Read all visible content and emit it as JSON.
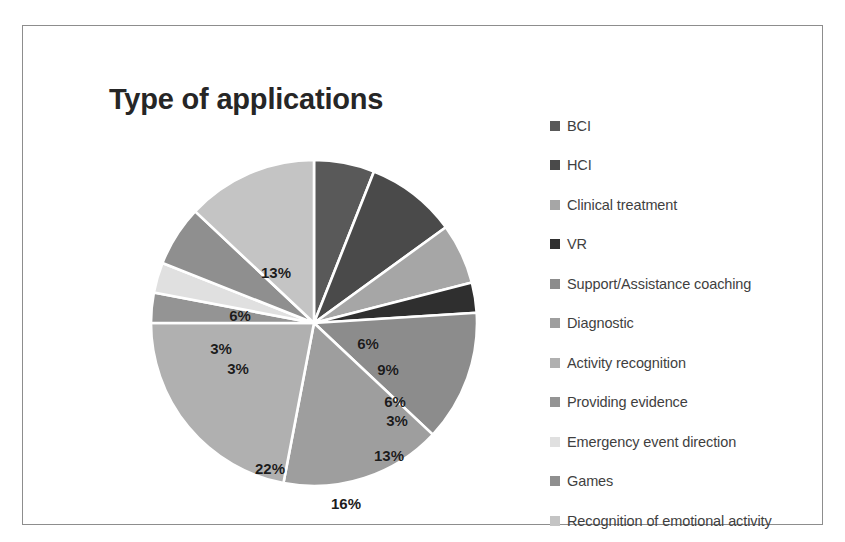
{
  "figure": {
    "title": "Type of applications",
    "frame_color": "#8d8d8d",
    "background": "#ffffff"
  },
  "chart_data": {
    "type": "pie",
    "title": "Type of applications",
    "xlabel": "",
    "ylabel": "",
    "legend_position": "right",
    "start_angle_deg": 0,
    "direction": "clockwise",
    "categories": [
      "BCI",
      "HCI",
      "Clinical treatment",
      "VR",
      "Support/Assistance coaching",
      "Diagnostic",
      "Activity recognition",
      "Providing evidence",
      "Emergency event direction",
      "Games",
      "Recognition of emotional activity"
    ],
    "values": [
      6,
      9,
      6,
      3,
      13,
      16,
      22,
      3,
      3,
      6,
      13
    ],
    "value_labels": [
      "6%",
      "9%",
      "6%",
      "3%",
      "13%",
      "16%",
      "22%",
      "3%",
      "3%",
      "6%",
      "13%"
    ],
    "colors": [
      "#595959",
      "#4a4a4a",
      "#a6a6a6",
      "#2f2f2f",
      "#8c8c8c",
      "#9e9e9e",
      "#b0b0b0",
      "#949494",
      "#e0e0e0",
      "#8f8f8f",
      "#c4c4c4"
    ],
    "slices": [
      {
        "label": "BCI",
        "value": 6,
        "value_label": "6%",
        "color": "#595959",
        "label_x": 54,
        "label_y": 20
      },
      {
        "label": "HCI",
        "value": 9,
        "value_label": "9%",
        "color": "#4a4a4a",
        "label_x": 74,
        "label_y": 46
      },
      {
        "label": "Clinical treatment",
        "value": 6,
        "value_label": "6%",
        "color": "#a6a6a6",
        "label_x": 81,
        "label_y": 78
      },
      {
        "label": "VR",
        "value": 3,
        "value_label": "3%",
        "color": "#2f2f2f",
        "label_x": 83,
        "label_y": 97
      },
      {
        "label": "Support/Assistance coaching",
        "value": 13,
        "value_label": "13%",
        "color": "#8c8c8c",
        "label_x": 75,
        "label_y": 132
      },
      {
        "label": "Diagnostic",
        "value": 16,
        "value_label": "16%",
        "color": "#9e9e9e",
        "label_x": 32,
        "label_y": 180
      },
      {
        "label": "Activity recognition",
        "value": 22,
        "value_label": "22%",
        "color": "#b0b0b0",
        "label_x": -44,
        "label_y": 145
      },
      {
        "label": "Providing evidence",
        "value": 3,
        "value_label": "3%",
        "color": "#949494",
        "label_x": -76,
        "label_y": 45
      },
      {
        "label": "Emergency event direction",
        "value": 3,
        "value_label": "3%",
        "color": "#e0e0e0",
        "label_x": -93,
        "label_y": 25
      },
      {
        "label": "Games",
        "value": 6,
        "value_label": "6%",
        "color": "#8f8f8f",
        "label_x": -74,
        "label_y": -8
      },
      {
        "label": "Recognition of emotional activity",
        "value": 13,
        "value_label": "13%",
        "color": "#c4c4c4",
        "label_x": -38,
        "label_y": -51
      }
    ]
  },
  "legend": {
    "items": [
      {
        "label": "BCI",
        "color": "#595959"
      },
      {
        "label": "HCI",
        "color": "#4a4a4a"
      },
      {
        "label": "Clinical treatment",
        "color": "#a6a6a6"
      },
      {
        "label": "VR",
        "color": "#2f2f2f"
      },
      {
        "label": "Support/Assistance coaching",
        "color": "#8c8c8c"
      },
      {
        "label": "Diagnostic",
        "color": "#9e9e9e"
      },
      {
        "label": "Activity recognition",
        "color": "#b0b0b0"
      },
      {
        "label": "Providing evidence",
        "color": "#949494"
      },
      {
        "label": "Emergency event direction",
        "color": "#e0e0e0"
      },
      {
        "label": "Games",
        "color": "#8f8f8f"
      },
      {
        "label": "Recognition of emotional activity",
        "color": "#c4c4c4"
      }
    ]
  }
}
